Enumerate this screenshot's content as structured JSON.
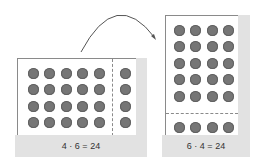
{
  "left_array": {
    "equation": "4 · 6 = 24",
    "rows": 4,
    "main_columns": 5,
    "split_columns": 1,
    "total": 24
  },
  "right_array": {
    "equation": "6 · 4 = 24",
    "columns": 4,
    "main_rows": 5,
    "split_rows": 1,
    "total": 24
  },
  "colors": {
    "dot": "#767676",
    "panel_shadow": "#e2e2e2",
    "border": "#8a8a8a",
    "arrow": "#555555"
  },
  "arrow": {
    "from": "left_array",
    "to": "right_array",
    "meaning": "rotate array"
  }
}
